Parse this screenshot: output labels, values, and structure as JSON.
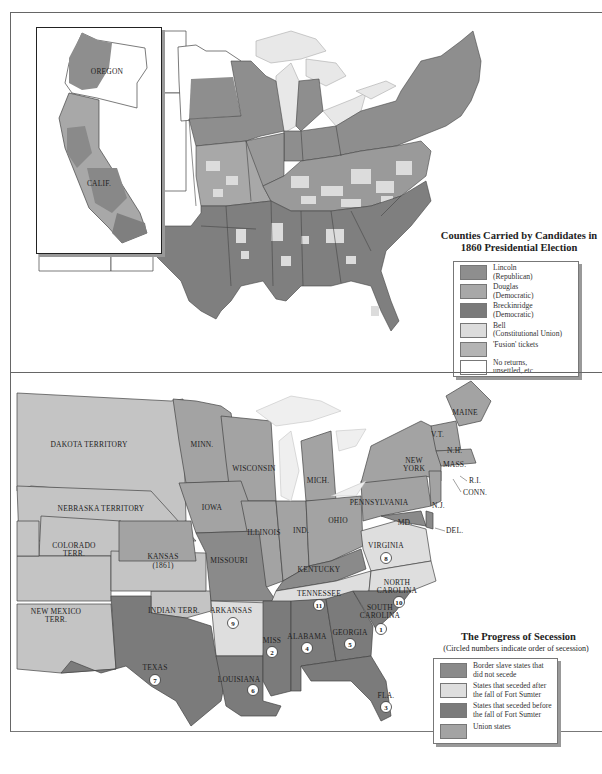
{
  "top_map": {
    "title_line1": "Counties Carried by Candidates in",
    "title_line2": "1860 Presidential Election",
    "inset_labels": {
      "oregon": "OREGON",
      "california": "CALIF."
    },
    "legend": [
      {
        "label_line1": "Lincoln",
        "label_line2": "(Republican)",
        "color": "#8e8e8e"
      },
      {
        "label_line1": "Douglas",
        "label_line2": "(Democratic)",
        "color": "#a8a8a8"
      },
      {
        "label_line1": "Breckinridge",
        "label_line2": "(Democratic)",
        "color": "#7a7a7a"
      },
      {
        "label_line1": "Bell",
        "label_line2": "(Constitutional Union)",
        "color": "#dcdcdc"
      },
      {
        "label_line1": "'Fusion' tickets",
        "label_line2": "",
        "color": "#b4b4b4"
      },
      {
        "label_line1": "No returns,",
        "label_line2": "unsettled, etc.",
        "color": "#ffffff"
      }
    ]
  },
  "bottom_map": {
    "title": "The Progress of Secession",
    "subtitle": "(Circled numbers indicate order of secession)",
    "legend": [
      {
        "label_line1": "Border slave states that",
        "label_line2": "did not secede",
        "color": "#8a8a8a"
      },
      {
        "label_line1": "States that seceded after",
        "label_line2": "the fall of Fort Sumter",
        "color": "#dedede"
      },
      {
        "label_line1": "States that seceded before",
        "label_line2": "the fall of Fort Sumter",
        "color": "#7b7b7b"
      },
      {
        "label_line1": "Union states",
        "label_line2": "",
        "color": "#a3a3a3"
      }
    ],
    "territory_color": "#c4c4c4",
    "states": {
      "dakota": "DAKOTA TERRITORY",
      "nebraska": "NEBRASKA TERRITORY",
      "colorado1": "COLORADO",
      "colorado2": "TERR.",
      "kansas1": "KANSAS",
      "kansas2": "(1861)",
      "newmexico1": "NEW MEXICO",
      "newmexico2": "TERR.",
      "indian": "INDIAN TERR.",
      "texas": "TEXAS",
      "minn": "MINN.",
      "wisconsin": "WISCONSIN",
      "iowa": "IOWA",
      "missouri": "MISSOURI",
      "illinois": "ILLINOIS",
      "ind": "IND.",
      "ohio": "OHIO",
      "mich": "MICH.",
      "kentucky": "KENTUCKY",
      "tennessee": "TENNESSEE",
      "arkansas": "ARKANSAS",
      "louisiana": "LOUISIANA",
      "miss": "MISS",
      "alabama": "ALABAMA",
      "georgia": "GEORGIA",
      "fla": "FLA.",
      "sc1": "SOUTH",
      "sc2": "CAROLINA",
      "nc1": "NORTH",
      "nc2": "CAROLINA",
      "virginia": "VIRGINIA",
      "md": "MD.",
      "del": "DEL.",
      "nj": "N.J.",
      "pennsylvania": "PENNSYLVANIA",
      "ny1": "NEW",
      "ny2": "YORK",
      "vt": "V.T.",
      "nh": "N.H.",
      "mass": "MASS.",
      "ri": "R.I.",
      "conn": "CONN.",
      "maine": "MAINE"
    },
    "secession_order": {
      "south_carolina": "1",
      "mississippi": "2",
      "florida": "3",
      "alabama": "4",
      "georgia": "5",
      "louisiana": "6",
      "texas": "7",
      "virginia": "8",
      "arkansas": "9",
      "north_carolina": "10",
      "tennessee": "11"
    }
  }
}
